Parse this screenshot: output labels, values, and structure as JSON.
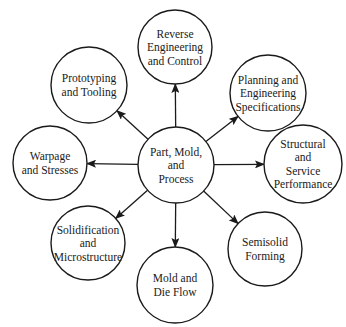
{
  "diagram": {
    "type": "hub-and-spoke",
    "center": {
      "id": "part-mold-process",
      "lines": [
        "Part, Mold,",
        "and",
        "Process"
      ],
      "cx": 176,
      "cy": 165,
      "r": 38
    },
    "nodes": [
      {
        "id": "reverse-engineering",
        "lines": [
          "Reverse",
          "Engineering",
          "and Control"
        ],
        "cx": 175,
        "cy": 47,
        "r": 37
      },
      {
        "id": "planning-engineering",
        "lines": [
          "Planning and",
          "Engineering",
          "Specifications"
        ],
        "cx": 268,
        "cy": 93,
        "r": 38
      },
      {
        "id": "structural-service",
        "lines": [
          "Structural",
          "and",
          "Service",
          "Performance"
        ],
        "cx": 303,
        "cy": 164,
        "r": 39
      },
      {
        "id": "semisolid-forming",
        "lines": [
          "Semisolid",
          "Forming"
        ],
        "cx": 265,
        "cy": 249,
        "r": 37
      },
      {
        "id": "mold-die-flow",
        "lines": [
          "Mold and",
          "Die Flow"
        ],
        "cx": 175,
        "cy": 285,
        "r": 38
      },
      {
        "id": "solidification",
        "lines": [
          "Solidification",
          "and",
          "Microstructure"
        ],
        "cx": 88,
        "cy": 243,
        "r": 37
      },
      {
        "id": "warpage-stresses",
        "lines": [
          "Warpage",
          "and Stresses"
        ],
        "cx": 50,
        "cy": 163,
        "r": 37
      },
      {
        "id": "prototyping-tooling",
        "lines": [
          "Prototyping",
          "and Tooling"
        ],
        "cx": 89,
        "cy": 85,
        "r": 38
      }
    ],
    "edges_from_center_to_each_node": true,
    "stroke_color": "#1a1a1a",
    "background": "#ffffff"
  }
}
